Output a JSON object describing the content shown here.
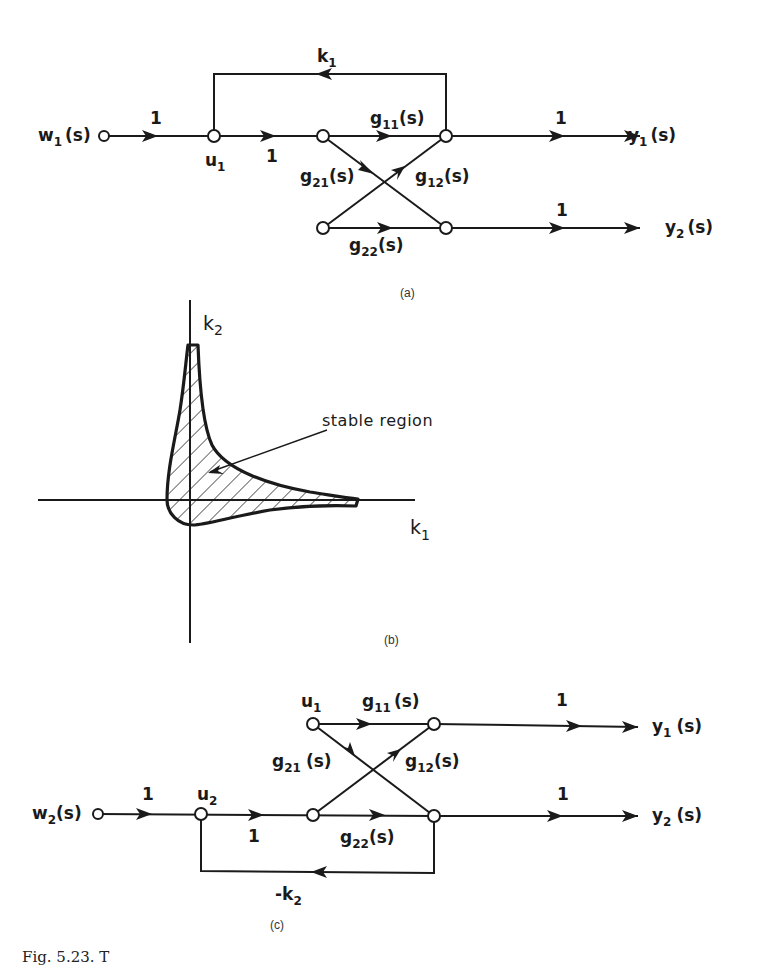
{
  "panel_a": {
    "label": "(a)",
    "input": {
      "name": "w",
      "sub": "1",
      "suffix": "(s)"
    },
    "outputs": [
      {
        "name": "y",
        "sub": "1",
        "suffix": "(s)"
      },
      {
        "name": "y",
        "sub": "2",
        "suffix": "(s)"
      }
    ],
    "node_u": {
      "name": "u",
      "sub": "1"
    },
    "feedback_gain": {
      "name": "k",
      "sub": "1"
    },
    "unit_gain": "1",
    "transfer": {
      "g11": {
        "name": "g",
        "sub": "11",
        "suffix": "(s)"
      },
      "g21": {
        "name": "g",
        "sub": "21",
        "suffix": "(s)"
      },
      "g12": {
        "name": "g",
        "sub": "12",
        "suffix": "(s)"
      },
      "g22": {
        "name": "g",
        "sub": "22",
        "suffix": "(s)"
      }
    }
  },
  "panel_b": {
    "label": "(b)",
    "x_axis": {
      "name": "k",
      "sub": "1"
    },
    "y_axis": {
      "name": "k",
      "sub": "2"
    },
    "region_label": "stable region"
  },
  "panel_c": {
    "label": "(c)",
    "input": {
      "name": "w",
      "sub": "2",
      "suffix": "(s)"
    },
    "outputs": [
      {
        "name": "y",
        "sub": "1",
        "suffix": "(s)"
      },
      {
        "name": "y",
        "sub": "2",
        "suffix": "(s)"
      }
    ],
    "node_u1": {
      "name": "u",
      "sub": "1"
    },
    "node_u2": {
      "name": "u",
      "sub": "2"
    },
    "feedback_gain": {
      "name": "-k",
      "sub": "2"
    },
    "unit_gain": "1",
    "transfer": {
      "g11": {
        "name": "g",
        "sub": "11",
        "suffix": "(s)"
      },
      "g21": {
        "name": "g",
        "sub": "21",
        "suffix": "(s)"
      },
      "g12": {
        "name": "g",
        "sub": "12",
        "suffix": "(s)"
      },
      "g22": {
        "name": "g",
        "sub": "22",
        "suffix": "(s)"
      }
    }
  },
  "caption": "Fig. 5.23. T"
}
